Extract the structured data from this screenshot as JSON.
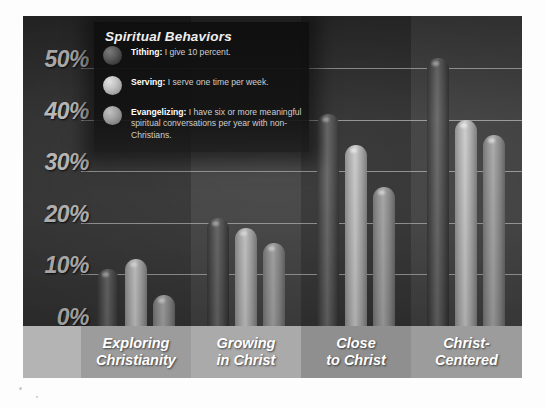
{
  "legend": {
    "title": "Spiritual Behaviors",
    "items": [
      {
        "name": "Tithing",
        "label_bold": "Tithing:",
        "label_rest": " I give 10 percent.",
        "swatch": "sphere-dark-icon",
        "color": "#4a4a4a"
      },
      {
        "name": "Serving",
        "label_bold": "Serving:",
        "label_rest": " I serve one time per week.",
        "swatch": "sphere-light-icon",
        "color": "#c4c4c4"
      },
      {
        "name": "Evangelizing",
        "label_bold": "Evangelizing:",
        "label_rest": " I have six or more meaningful  spiritual conversations per year with non-Christians.",
        "swatch": "sphere-mid-icon",
        "color": "#9b9b9b"
      }
    ]
  },
  "axis": {
    "yticks": [
      "50%",
      "40%",
      "30%",
      "20%",
      "10%",
      "0%"
    ]
  },
  "footer": {
    "spacer": "",
    "labels": [
      "Exploring\nChristianity",
      "Growing\nin Christ",
      "Close\nto Christ",
      "Christ-\nCentered"
    ]
  },
  "chart_data": {
    "type": "bar",
    "title": "Spiritual Behaviors",
    "xlabel": "",
    "ylabel": "",
    "ylim": [
      0,
      50
    ],
    "ytick_values": [
      0,
      10,
      20,
      30,
      40,
      50
    ],
    "grid": true,
    "legend_position": "top-left",
    "categories": [
      "Exploring Christianity",
      "Growing in Christ",
      "Close to Christ",
      "Christ-Centered"
    ],
    "series": [
      {
        "name": "Tithing",
        "values": [
          11,
          21,
          41,
          52
        ]
      },
      {
        "name": "Serving",
        "values": [
          13,
          19,
          35,
          40
        ]
      },
      {
        "name": "Evangelizing",
        "values": [
          6,
          16,
          27,
          37
        ]
      }
    ]
  }
}
